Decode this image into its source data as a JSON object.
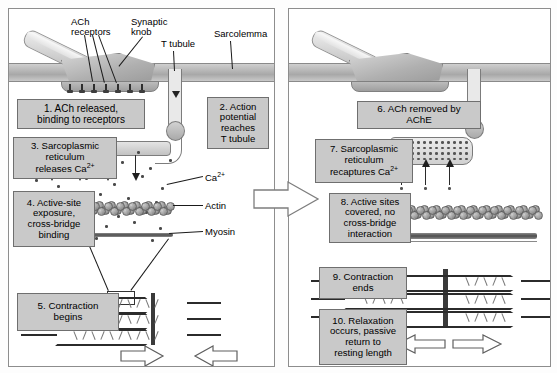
{
  "figure": {
    "panel_left_name": "contraction-panel",
    "panel_right_name": "relaxation-panel"
  },
  "annotations": {
    "ach_receptors": "ACh\nreceptors",
    "synaptic_knob": "Synaptic\nknob",
    "t_tubule": "T tubule",
    "sarcolemma": "Sarcolemma",
    "calcium": "Ca2+",
    "calcium_sup": "Ca",
    "actin": "Actin",
    "myosin": "Myosin"
  },
  "steps_left": [
    {
      "n": 1,
      "text": "1. ACh released,\nbinding to receptors"
    },
    {
      "n": 2,
      "text": "2. Action\npotential\nreaches\nT tubule"
    },
    {
      "n": 3,
      "text": "3. Sarcoplasmic\nreticulum\nreleases Ca2+"
    },
    {
      "n": 4,
      "text": "4. Active-site\nexposure,\ncross-bridge\nbinding"
    },
    {
      "n": 5,
      "text": "5. Contraction\nbegins"
    }
  ],
  "steps_right": [
    {
      "n": 6,
      "text": "6. ACh removed by\nAChE"
    },
    {
      "n": 7,
      "text": "7. Sarcoplasmic\nreticulum\nrecaptures Ca2+"
    },
    {
      "n": 8,
      "text": "8. Active sites\ncovered, no\ncross-bridge\ninteraction"
    },
    {
      "n": 9,
      "text": "9. Contraction\nends"
    },
    {
      "n": 10,
      "text": "10. Relaxation\noccurs, passive\nreturn to\nresting length"
    }
  ],
  "arrows": {
    "transition": "transition-arrow-right",
    "contraction_in_left": "contraction-arrow-left",
    "contraction_in_right": "contraction-arrow-right",
    "relaxation_double": "relaxation-double-arrow"
  },
  "colors": {
    "box_fill": "#c9c9c9",
    "box_border": "#6f6f6f",
    "membrane": "#b6b6b6",
    "panel_border": "#8d8d8d",
    "ink": "#111111"
  }
}
